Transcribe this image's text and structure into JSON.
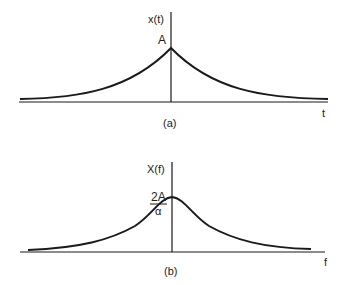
{
  "panel_a": {
    "y_label": "x(t)",
    "peak_label": "A",
    "x_label": "t",
    "caption": "(a)",
    "curve_type": "two-sided exponential"
  },
  "panel_b": {
    "y_label": "X(f)",
    "peak_label_numerator": "2A",
    "peak_label_denominator": "α",
    "x_label": "f",
    "caption": "(b)",
    "curve_type": "Lorentzian"
  },
  "colors": {
    "stroke": "#1a1a1a",
    "background": "#ffffff"
  }
}
